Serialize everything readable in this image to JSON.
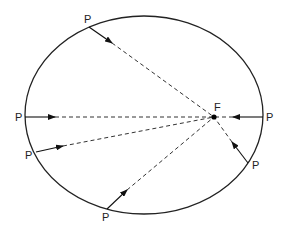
{
  "diagram": {
    "type": "ellipse-focus-rays",
    "ellipse": {
      "cx": 144,
      "cy": 115,
      "rx": 119,
      "ry": 99,
      "stroke": "#222222"
    },
    "focus": {
      "label": "F",
      "x": 214,
      "y": 117,
      "label_x": 214,
      "label_y": 111
    },
    "points": [
      {
        "label": "P",
        "x": 89,
        "y": 27,
        "label_x": 84,
        "label_y": 23,
        "arrow_tip": [
          112,
          43
        ]
      },
      {
        "label": "P",
        "x": 25,
        "y": 117,
        "label_x": 15,
        "label_y": 121,
        "arrow_tip": [
          55,
          117
        ]
      },
      {
        "label": "P",
        "x": 36,
        "y": 152,
        "label_x": 25,
        "label_y": 159,
        "arrow_tip": [
          63,
          146
        ]
      },
      {
        "label": "P",
        "x": 107,
        "y": 209,
        "label_x": 102,
        "label_y": 221,
        "arrow_tip": [
          127,
          190
        ]
      },
      {
        "label": "P",
        "x": 248,
        "y": 163,
        "label_x": 252,
        "label_y": 169,
        "arrow_tip": [
          232,
          142
        ]
      },
      {
        "label": "P",
        "x": 263,
        "y": 117,
        "label_x": 266,
        "label_y": 121,
        "arrow_tip": [
          233,
          117
        ]
      }
    ]
  }
}
